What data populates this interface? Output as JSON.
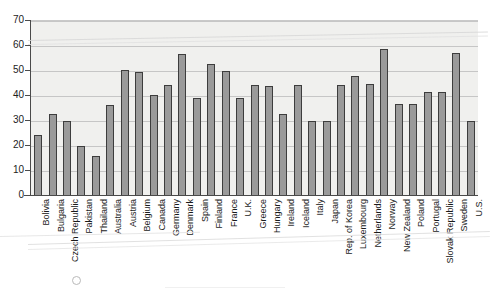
{
  "chart_data": {
    "type": "bar",
    "title": "",
    "subtitle": "",
    "xlabel": "",
    "ylabel": "",
    "ylim": [
      0,
      70
    ],
    "yticks": [
      0,
      10,
      20,
      30,
      40,
      50,
      60,
      70
    ],
    "grid": true,
    "legend": "none",
    "bar_color": "#9a9a9a",
    "bar_edge_color": "#3d3d3d",
    "plot_background": "#f0f0ee",
    "categories": [
      "Bolivia",
      "Bulgaria",
      "Czech Republic",
      "Pakistan",
      "Thailand",
      "Australia",
      "Austria",
      "Belgium",
      "Canada",
      "Germany",
      "Denmark",
      "Spain",
      "Finland",
      "France",
      "U.K.",
      "Greece",
      "Hungary",
      "Ireland",
      "Iceland",
      "Italy",
      "Japan",
      "Rep. of Korea",
      "Luxembourg",
      "Netherlands",
      "Norway",
      "New Zealand",
      "Poland",
      "Portugal",
      "Slovak Republic",
      "Sweden",
      "U.S."
    ],
    "values": [
      24.0,
      32.5,
      29.5,
      19.5,
      15.5,
      36.0,
      50.0,
      49.2,
      40.0,
      44.2,
      56.5,
      38.7,
      52.5,
      49.7,
      38.7,
      44.0,
      43.5,
      32.5,
      44.0,
      29.8,
      29.8,
      44.0,
      47.5,
      44.5,
      58.5,
      36.3,
      36.3,
      41.2,
      41.2,
      57.0,
      29.8
    ]
  }
}
